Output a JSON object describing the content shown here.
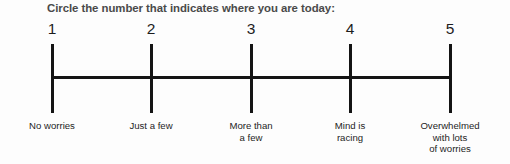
{
  "worksheet": {
    "prompt": "Circle the number that indicates where you are today:",
    "scale": {
      "min": 1,
      "max": 5,
      "points": [
        {
          "number": "1",
          "x": 52,
          "label_lines": [
            "No worries"
          ]
        },
        {
          "number": "2",
          "x": 151,
          "label_lines": [
            "Just a few"
          ]
        },
        {
          "number": "3",
          "x": 251,
          "label_lines": [
            "More than",
            "a few"
          ]
        },
        {
          "number": "4",
          "x": 350,
          "label_lines": [
            "Mind is",
            "racing"
          ]
        },
        {
          "number": "5",
          "x": 450,
          "label_lines": [
            "Overwhelmed",
            "with lots",
            "of worries"
          ]
        }
      ]
    },
    "colors": {
      "ink": "#141414",
      "text": "#1d1d1d",
      "heading": "#4a4a4a",
      "background": "#fdfdfd"
    }
  }
}
